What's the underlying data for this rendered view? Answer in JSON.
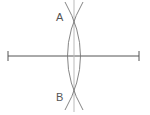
{
  "diagram": {
    "type": "perpendicular-bisector-construction",
    "points": {
      "A": {
        "label": "A"
      },
      "B": {
        "label": "B"
      }
    },
    "colors": {
      "segment": "#555555",
      "arcs": "#777777",
      "bisector": "#aaaaaa",
      "labels": "#555555"
    }
  }
}
